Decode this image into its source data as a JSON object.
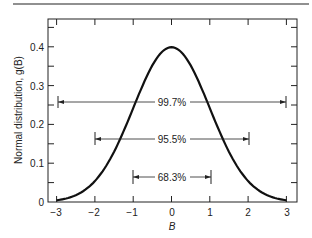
{
  "chart_data": {
    "type": "line",
    "title": "",
    "xlabel": "B",
    "ylabel": "Normal distribution, g(B)",
    "xlim": [
      -3,
      3
    ],
    "ylim": [
      0,
      0.46
    ],
    "x_ticks": [
      "-3",
      "-2",
      "-1",
      "0",
      "1",
      "2",
      "3"
    ],
    "y_ticks": [
      "0",
      "0.1",
      "0.2",
      "0.3",
      "0.4"
    ],
    "grid": false,
    "series": [
      {
        "name": "g(B)",
        "x": [
          -3,
          -2.5,
          -2,
          -1.5,
          -1,
          -0.5,
          0,
          0.5,
          1,
          1.5,
          2,
          2.5,
          3
        ],
        "values": [
          0.004,
          0.018,
          0.054,
          0.13,
          0.242,
          0.352,
          0.399,
          0.352,
          0.242,
          0.13,
          0.054,
          0.018,
          0.004
        ]
      }
    ],
    "annotations": [
      {
        "label": "99.7%",
        "from": -3,
        "to": 3,
        "y": 0.26
      },
      {
        "label": "95.5%",
        "from": -2,
        "to": 2,
        "y": 0.16
      },
      {
        "label": "68.3%",
        "from": -1,
        "to": 1,
        "y": 0.065
      }
    ]
  },
  "labels": {
    "xlabel": "B",
    "ylabel": "Normal distribution, g(B)",
    "x_ticks": [
      "−3",
      "−2",
      "−1",
      "0",
      "1",
      "2",
      "3"
    ],
    "y_ticks": [
      "0",
      "0.1",
      "0.2",
      "0.3",
      "0.4"
    ],
    "ann1": "99.7%",
    "ann2": "95.5%",
    "ann3": "68.3%"
  }
}
